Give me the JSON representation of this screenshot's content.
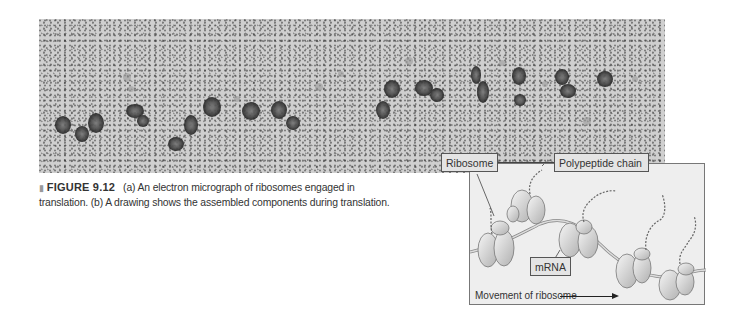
{
  "figure": {
    "number": "FIGURE 9.12",
    "caption": "(a) An electron micrograph of ribosomes engaged in translation. (b) A drawing shows the assembled components during translation.",
    "caption_line1": "(a) An electron micrograph of ribosomes engaged in",
    "caption_line2": "translation. (b) A drawing shows the assembled components during translation.",
    "marker_icon": "triangle-bullet-icon"
  },
  "panel_a": {
    "type": "electron-micrograph",
    "subject": "ribosomes engaged in translation"
  },
  "panel_b": {
    "type": "diagram",
    "labels": {
      "ribosome": "Ribosome",
      "polypeptide": "Polypeptide chain",
      "mrna": "mRNA",
      "movement": "Movement of ribosome"
    },
    "colors": {
      "background": "#eeeeee",
      "label_fill": "#e4e4e4",
      "border": "#555555"
    }
  }
}
